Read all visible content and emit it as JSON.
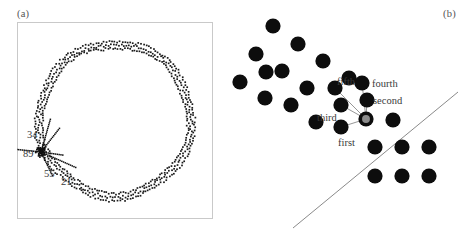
{
  "figure": {
    "type": "scientific-diagram",
    "background_color": "#ffffff",
    "dot_color": "#0d0d0d",
    "line_color": "#8a8a8a",
    "frame_color": "#c9c9c9",
    "highlight_color": "#8c8c8c"
  },
  "panel_a": {
    "tag": "(a)",
    "frame": {
      "x": 17,
      "y": 22,
      "width": 196,
      "height": 197,
      "visible": true
    },
    "description": "dotted annular ring of small square points with parastichy rays converging at a point on the lower-left of the ring",
    "parastichy_labels": [
      {
        "text": "34",
        "x": 27,
        "y": 129
      },
      {
        "text": "89",
        "x": 23,
        "y": 148
      },
      {
        "text": "55",
        "x": 44,
        "y": 168
      },
      {
        "text": "21",
        "x": 61,
        "y": 176
      }
    ],
    "ring": {
      "center_x": 98,
      "center_y": 98,
      "radius": 76,
      "band_thickness": 9,
      "dot_size": 1.7,
      "dot_count": 560
    },
    "convergence_point": {
      "x": 41,
      "y": 152
    },
    "rays": [
      {
        "label": "34",
        "angle_deg": -74,
        "length": 34,
        "dotted": true
      },
      {
        "label": "89",
        "angle_deg": 186,
        "length": 28,
        "dotted": true
      },
      {
        "label": "55",
        "angle_deg": 64,
        "length": 26,
        "dotted": true
      },
      {
        "label": "21",
        "angle_deg": 24,
        "length": 38,
        "dotted": true
      },
      {
        "label": "extra",
        "angle_deg": -52,
        "length": 30,
        "dotted": true
      },
      {
        "label": "extra2",
        "angle_deg": 8,
        "length": 22,
        "dotted": true
      }
    ]
  },
  "panel_b": {
    "tag": "(b)",
    "description": "hexagonal-ish lattice of large filled dots; a highlighted origin dot is joined by thin connectors to its five nearest neighbours; an oblique straight line passes through the origin",
    "dot_radius": 7.6,
    "origin": {
      "x": 141,
      "y": 119
    },
    "ordinal_labels": [
      {
        "text": "first",
        "x": 113,
        "y": 137
      },
      {
        "text": "second",
        "x": 148,
        "y": 95
      },
      {
        "text": "third",
        "x": 92,
        "y": 112
      },
      {
        "text": "fourth",
        "x": 147,
        "y": 78
      },
      {
        "text": "fifth",
        "x": 112,
        "y": 76
      }
    ],
    "neighbours": [
      {
        "ordinal": "first",
        "x": 116,
        "y": 127
      },
      {
        "ordinal": "second",
        "x": 142,
        "y": 100
      },
      {
        "ordinal": "third",
        "x": 116,
        "y": 105
      },
      {
        "ordinal": "fourth",
        "x": 137,
        "y": 83
      },
      {
        "ordinal": "fifth",
        "x": 110,
        "y": 88
      }
    ],
    "axis_line": {
      "x1": 68,
      "y1": 228,
      "x2": 233,
      "y2": 92
    },
    "lattice_dots": [
      {
        "x": 48,
        "y": 26
      },
      {
        "x": 73,
        "y": 44
      },
      {
        "x": 31,
        "y": 54
      },
      {
        "x": 98,
        "y": 61
      },
      {
        "x": 57,
        "y": 71
      },
      {
        "x": 124,
        "y": 78
      },
      {
        "x": 82,
        "y": 88
      },
      {
        "x": 40,
        "y": 98
      },
      {
        "x": 110,
        "y": 88
      },
      {
        "x": 66,
        "y": 105
      },
      {
        "x": 137,
        "y": 83
      },
      {
        "x": 91,
        "y": 122
      },
      {
        "x": 116,
        "y": 105
      },
      {
        "x": 142,
        "y": 100
      },
      {
        "x": 116,
        "y": 127
      },
      {
        "x": 168,
        "y": 120
      },
      {
        "x": 150,
        "y": 147
      },
      {
        "x": 177,
        "y": 147
      },
      {
        "x": 204,
        "y": 147
      },
      {
        "x": 150,
        "y": 176
      },
      {
        "x": 177,
        "y": 176
      },
      {
        "x": 204,
        "y": 176
      },
      {
        "x": 41,
        "y": 72
      },
      {
        "x": 15,
        "y": 82
      }
    ]
  }
}
